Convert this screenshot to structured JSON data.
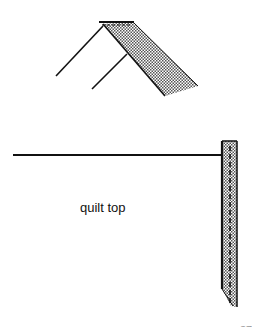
{
  "figure": {
    "labels": {
      "quilt_top": "quilt top",
      "page_number": "37"
    },
    "colors": {
      "line": "#111111",
      "fabric_fill": "#9a9a9a",
      "background": "#ffffff"
    },
    "parts": [
      "folded-binding-strip",
      "quilt-top-edge-line",
      "binding-strip-attached"
    ]
  }
}
